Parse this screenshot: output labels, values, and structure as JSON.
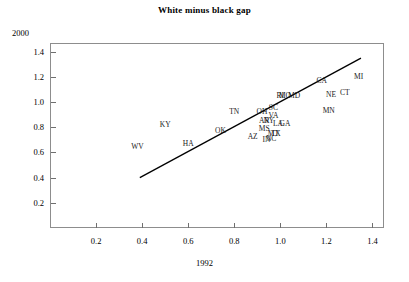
{
  "chart_data": {
    "type": "scatter",
    "title": "White minus black gap",
    "xlabel": "1992",
    "ylabel": "2000",
    "xlim": [
      0.0,
      1.45
    ],
    "ylim": [
      0.0,
      1.47
    ],
    "grid": false,
    "legend": "none",
    "point_label_mode": "state-abbreviation",
    "xticks": [
      "0.2",
      "0.4",
      "0.6",
      "0.8",
      "1.0",
      "1.2",
      "1.4"
    ],
    "xtick_values": [
      0.2,
      0.4,
      0.6,
      0.8,
      1.0,
      1.2,
      1.4
    ],
    "yticks": [
      "0.2",
      "0.4",
      "0.6",
      "0.8",
      "1.0",
      "1.2",
      "1.4"
    ],
    "ytick_values": [
      0.2,
      0.4,
      0.6,
      0.8,
      1.0,
      1.2,
      1.4
    ],
    "points": [
      {
        "label": "WV",
        "x": 0.38,
        "y": 0.64
      },
      {
        "label": "KY",
        "x": 0.5,
        "y": 0.82
      },
      {
        "label": "HA",
        "x": 0.6,
        "y": 0.67
      },
      {
        "label": "OK",
        "x": 0.74,
        "y": 0.77
      },
      {
        "label": "TN",
        "x": 0.8,
        "y": 0.92
      },
      {
        "label": "AZ",
        "x": 0.88,
        "y": 0.72
      },
      {
        "label": "OH",
        "x": 0.92,
        "y": 0.92
      },
      {
        "label": "AR",
        "x": 0.93,
        "y": 0.85
      },
      {
        "label": "MS",
        "x": 0.93,
        "y": 0.79
      },
      {
        "label": "IN",
        "x": 0.94,
        "y": 0.7
      },
      {
        "label": "NY",
        "x": 0.95,
        "y": 0.85
      },
      {
        "label": "NC",
        "x": 0.96,
        "y": 0.71
      },
      {
        "label": "MT",
        "x": 0.97,
        "y": 0.75
      },
      {
        "label": "TX",
        "x": 0.98,
        "y": 0.75
      },
      {
        "label": "SC",
        "x": 0.97,
        "y": 0.95
      },
      {
        "label": "VA",
        "x": 0.97,
        "y": 0.89
      },
      {
        "label": "LA",
        "x": 0.99,
        "y": 0.83
      },
      {
        "label": "GA",
        "x": 1.02,
        "y": 0.83
      },
      {
        "label": "RI",
        "x": 1.0,
        "y": 1.05
      },
      {
        "label": "MO",
        "x": 1.02,
        "y": 1.05
      },
      {
        "label": "MD",
        "x": 1.06,
        "y": 1.05
      },
      {
        "label": "CA",
        "x": 1.18,
        "y": 1.17
      },
      {
        "label": "NE",
        "x": 1.22,
        "y": 1.06
      },
      {
        "label": "MN",
        "x": 1.21,
        "y": 0.93
      },
      {
        "label": "CT",
        "x": 1.28,
        "y": 1.07
      },
      {
        "label": "MI",
        "x": 1.34,
        "y": 1.2
      }
    ],
    "fit_line": {
      "type": "linear-fit",
      "x_start": 0.39,
      "y_start": 0.4,
      "x_end": 1.35,
      "y_end": 1.35,
      "color": "#000000"
    },
    "colors": {
      "frame": "#8d8d8d",
      "tick": "#6f6f6f",
      "text": "#000000",
      "line": "#000000",
      "background": "#ffffff"
    }
  }
}
